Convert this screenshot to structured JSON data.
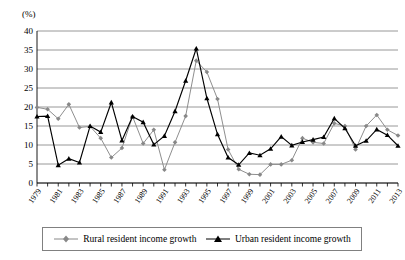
{
  "chart_data": {
    "type": "line",
    "title": "",
    "subtitle": "",
    "xlabel": "",
    "ylabel": "(%)",
    "unit_label": "(%)",
    "ylim": [
      0,
      40
    ],
    "ytick_step": 5,
    "ytick_labels": [
      "0",
      "5",
      "10",
      "15",
      "20",
      "25",
      "30",
      "35",
      "40"
    ],
    "grid": true,
    "grid_axis": "y",
    "legend_position": "bottom",
    "x": [
      1979,
      1980,
      1981,
      1982,
      1983,
      1984,
      1985,
      1986,
      1987,
      1988,
      1989,
      1990,
      1991,
      1992,
      1993,
      1994,
      1995,
      1996,
      1997,
      1998,
      1999,
      2000,
      2001,
      2002,
      2003,
      2004,
      2005,
      2006,
      2007,
      2008,
      2009,
      2010,
      2011,
      2012,
      2013
    ],
    "xtick_labels": [
      "1979",
      "1981",
      "1983",
      "1985",
      "1987",
      "1989",
      "1991",
      "1993",
      "1995",
      "1997",
      "1999",
      "2001",
      "2003",
      "2005",
      "2007",
      "2009",
      "2011",
      "2013"
    ],
    "xtick_labels_all": [
      "1979",
      "1980",
      "1981",
      "1982",
      "1983",
      "1984",
      "1985",
      "1986",
      "1987",
      "1988",
      "1989",
      "1990",
      "1991",
      "1992",
      "1993",
      "1994",
      "1995",
      "1996",
      "1997",
      "1998",
      "1999",
      "2000",
      "2001",
      "2002",
      "2003",
      "2004",
      "2005",
      "2006",
      "2007",
      "2008",
      "2009",
      "2010",
      "2011",
      "2012",
      "2013"
    ],
    "series": [
      {
        "name": "Rural resident income growth",
        "color": "#888888",
        "marker": "diamond",
        "values": [
          19.9,
          19.4,
          16.9,
          20.7,
          14.6,
          14.9,
          11.8,
          6.7,
          9.2,
          17.5,
          10.4,
          14.0,
          3.5,
          10.7,
          17.6,
          32.2,
          29.2,
          22.1,
          8.8,
          3.6,
          2.3,
          2.2,
          4.9,
          4.9,
          6.0,
          11.8,
          10.7,
          10.4,
          15.7,
          15.0,
          8.8,
          15.0,
          17.9,
          14.0,
          12.5
        ]
      },
      {
        "name": "Urban resident income growth",
        "color": "#000000",
        "marker": "triangle",
        "values": [
          17.5,
          17.6,
          4.7,
          6.4,
          5.4,
          15.0,
          13.4,
          21.2,
          11.2,
          17.5,
          16.0,
          10.1,
          12.4,
          18.9,
          26.9,
          35.4,
          22.3,
          12.8,
          6.7,
          4.8,
          7.9,
          7.3,
          9.0,
          12.2,
          9.9,
          10.8,
          11.4,
          12.1,
          17.0,
          14.4,
          9.8,
          11.1,
          14.1,
          12.6,
          9.8
        ]
      }
    ]
  },
  "legend": {
    "items": [
      {
        "label": "Rural resident income growth",
        "marker": "diamond-gray"
      },
      {
        "label": "Urban resident income growth",
        "marker": "triangle-black"
      }
    ]
  }
}
